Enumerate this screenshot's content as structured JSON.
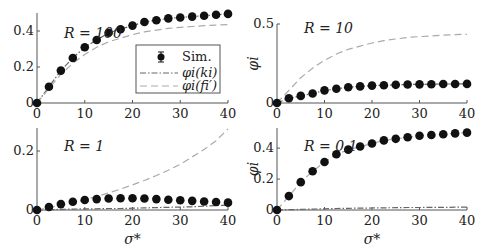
{
  "figure": {
    "legend": {
      "items": [
        {
          "label": "Sim.",
          "style": "marker"
        },
        {
          "label": "φi(ki)",
          "style": "dashdot"
        },
        {
          "label": "φi(fi′)",
          "style": "dashed"
        }
      ]
    },
    "xlabel": "σ*",
    "ylabel": "φi"
  },
  "chart_data": [
    {
      "type": "line",
      "panel": "top-left",
      "annotation": "R = 100",
      "x": [
        0,
        2.5,
        5,
        7.5,
        10,
        12.5,
        15,
        17.5,
        20,
        22.5,
        25,
        27.5,
        30,
        32.5,
        35,
        37.5,
        40
      ],
      "series": [
        {
          "name": "Sim.",
          "values": [
            0,
            0.09,
            0.18,
            0.25,
            0.31,
            0.35,
            0.39,
            0.41,
            0.43,
            0.45,
            0.46,
            0.47,
            0.475,
            0.48,
            0.485,
            0.49,
            0.495
          ]
        },
        {
          "name": "φi(ki)",
          "values": [
            0,
            0.09,
            0.18,
            0.25,
            0.31,
            0.35,
            0.39,
            0.41,
            0.43,
            0.45,
            0.46,
            0.47,
            0.475,
            0.48,
            0.485,
            0.49,
            0.495
          ]
        },
        {
          "name": "φi(fi′)",
          "values": [
            0,
            0.08,
            0.16,
            0.22,
            0.27,
            0.31,
            0.34,
            0.36,
            0.38,
            0.395,
            0.405,
            0.415,
            0.42,
            0.425,
            0.43,
            0.433,
            0.435
          ]
        }
      ],
      "xlim": [
        0,
        40
      ],
      "ylim": [
        0,
        0.5
      ],
      "xticks": [
        0,
        10,
        20,
        30,
        40
      ],
      "yticks": [
        0,
        0.2,
        0.4
      ],
      "xlabel": "",
      "ylabel": ""
    },
    {
      "type": "line",
      "panel": "top-right",
      "annotation": "R = 10",
      "x": [
        0,
        2.5,
        5,
        7.5,
        10,
        12.5,
        15,
        17.5,
        20,
        22.5,
        25,
        27.5,
        30,
        32.5,
        35,
        37.5,
        40
      ],
      "series": [
        {
          "name": "Sim.",
          "values": [
            0,
            0.03,
            0.045,
            0.06,
            0.08,
            0.09,
            0.1,
            0.105,
            0.11,
            0.112,
            0.115,
            0.117,
            0.118,
            0.119,
            0.12,
            0.12,
            0.121
          ]
        },
        {
          "name": "φi(ki)",
          "values": [
            0,
            0.03,
            0.045,
            0.06,
            0.08,
            0.09,
            0.1,
            0.105,
            0.11,
            0.112,
            0.115,
            0.117,
            0.118,
            0.119,
            0.12,
            0.12,
            0.121
          ]
        },
        {
          "name": "φi(fi′)",
          "values": [
            0,
            0.08,
            0.16,
            0.22,
            0.27,
            0.31,
            0.34,
            0.36,
            0.38,
            0.395,
            0.405,
            0.415,
            0.42,
            0.425,
            0.43,
            0.433,
            0.435
          ]
        }
      ],
      "xlim": [
        0,
        40
      ],
      "ylim": [
        0,
        0.5
      ],
      "xticks": [
        0,
        10,
        20,
        30,
        40
      ],
      "yticks": [
        0,
        0.5
      ],
      "xlabel": "",
      "ylabel": "φi"
    },
    {
      "type": "line",
      "panel": "bottom-left",
      "annotation": "R = 1",
      "x": [
        0,
        2.5,
        5,
        7.5,
        10,
        12.5,
        15,
        17.5,
        20,
        22.5,
        25,
        27.5,
        30,
        32.5,
        35,
        37.5,
        40
      ],
      "series": [
        {
          "name": "Sim.",
          "values": [
            0,
            0.01,
            0.02,
            0.028,
            0.034,
            0.037,
            0.039,
            0.04,
            0.04,
            0.039,
            0.037,
            0.035,
            0.033,
            0.031,
            0.029,
            0.027,
            0.025
          ]
        },
        {
          "name": "φi(ki)",
          "values": [
            0,
            0.001,
            0.002,
            0.003,
            0.004,
            0.004,
            0.005,
            0.005,
            0.006,
            0.007,
            0.008,
            0.009,
            0.01,
            0.011,
            0.013,
            0.015,
            0.017
          ]
        },
        {
          "name": "φi(fi′)",
          "values": [
            0,
            0.008,
            0.016,
            0.025,
            0.035,
            0.046,
            0.058,
            0.071,
            0.085,
            0.1,
            0.117,
            0.135,
            0.155,
            0.18,
            0.205,
            0.235,
            0.275
          ]
        }
      ],
      "xlim": [
        0,
        40
      ],
      "ylim": [
        0,
        0.28
      ],
      "xticks": [
        0,
        10,
        20,
        30,
        40
      ],
      "yticks": [
        0,
        0.2
      ],
      "xlabel": "σ*",
      "ylabel": ""
    },
    {
      "type": "line",
      "panel": "bottom-right",
      "annotation": "R = 0.1",
      "x": [
        0,
        2.5,
        5,
        7.5,
        10,
        12.5,
        15,
        17.5,
        20,
        22.5,
        25,
        27.5,
        30,
        32.5,
        35,
        37.5,
        40
      ],
      "series": [
        {
          "name": "Sim.",
          "values": [
            0,
            0.09,
            0.18,
            0.25,
            0.31,
            0.36,
            0.39,
            0.41,
            0.43,
            0.45,
            0.46,
            0.47,
            0.48,
            0.485,
            0.49,
            0.495,
            0.5
          ]
        },
        {
          "name": "φi(ki)",
          "values": [
            0,
            0.002,
            0.004,
            0.006,
            0.008,
            0.01,
            0.011,
            0.012,
            0.013,
            0.014,
            0.015,
            0.016,
            0.016,
            0.017,
            0.017,
            0.018,
            0.018
          ]
        },
        {
          "name": "φi(fi′)",
          "values": [
            0,
            0.09,
            0.18,
            0.25,
            0.31,
            0.36,
            0.39,
            0.41,
            0.43,
            0.45,
            0.46,
            0.47,
            0.48,
            0.485,
            0.49,
            0.495,
            0.5
          ]
        }
      ],
      "xlim": [
        0,
        40
      ],
      "ylim": [
        0,
        0.52
      ],
      "xticks": [
        0,
        10,
        20,
        30,
        40
      ],
      "yticks": [
        0,
        0.2,
        0.4
      ],
      "xlabel": "σ*",
      "ylabel": "φi"
    }
  ],
  "layout": {
    "panels": [
      {
        "x0": 37,
        "x1": 228,
        "y0": 103,
        "ytop": 13,
        "ymax": 0.5
      },
      {
        "x0": 277,
        "x1": 467,
        "y0": 103,
        "ytop": 24,
        "ymax": 0.5
      },
      {
        "x0": 37,
        "x1": 228,
        "y0": 210,
        "ytop": 128,
        "ymax": 0.278
      },
      {
        "x0": 277,
        "x1": 467,
        "y0": 210,
        "ytop": 128,
        "ymax": 0.53
      }
    ],
    "colors": {
      "axis": "#555555",
      "marker": "#111111",
      "dashdot": "#666666",
      "dashed": "#aaaaaa",
      "text": "#222222"
    }
  }
}
